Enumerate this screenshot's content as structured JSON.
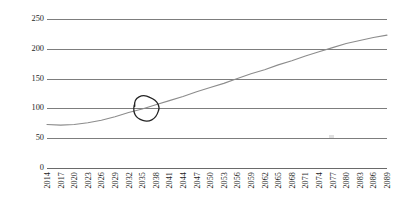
{
  "chart_data": {
    "type": "line",
    "title": "",
    "xlabel": "",
    "ylabel": "Percentage of GDP",
    "ylim": [
      0,
      250
    ],
    "yticks": [
      0,
      50,
      100,
      150,
      200,
      250
    ],
    "ytick_labels": [
      "0",
      "50",
      "100",
      "150",
      "200",
      "250"
    ],
    "grid": true,
    "legend": "none",
    "xlim": [
      2014,
      2089
    ],
    "xticks": [
      2014,
      2017,
      2020,
      2023,
      2026,
      2029,
      2032,
      2035,
      2038,
      2041,
      2044,
      2047,
      2050,
      2053,
      2056,
      2059,
      2062,
      2065,
      2068,
      2071,
      2074,
      2077,
      2080,
      2083,
      2086,
      2089
    ],
    "xtick_labels": [
      "2014",
      "2017",
      "2020",
      "2023",
      "2026",
      "2029",
      "2032",
      "2035",
      "2038",
      "2041",
      "2044",
      "2047",
      "2050",
      "2053",
      "2056",
      "2059",
      "2062",
      "2065",
      "2068",
      "2071",
      "2074",
      "2077",
      "2080",
      "2083",
      "2086",
      "2089"
    ],
    "series": [
      {
        "name": "Percentage of GDP",
        "color": "#8c8c8c",
        "x": [
          2014,
          2017,
          2020,
          2023,
          2026,
          2029,
          2032,
          2035,
          2038,
          2041,
          2044,
          2047,
          2050,
          2053,
          2056,
          2059,
          2062,
          2065,
          2068,
          2071,
          2074,
          2077,
          2080,
          2083,
          2086,
          2089
        ],
        "values": [
          73,
          72,
          73,
          76,
          80,
          86,
          93,
          99,
          106,
          113,
          120,
          128,
          135,
          142,
          150,
          158,
          165,
          173,
          180,
          188,
          195,
          202,
          209,
          214,
          219,
          223
        ]
      }
    ],
    "annotations": [
      {
        "name": "hand-drawn-circle",
        "shape": "ellipse",
        "color": "#232323",
        "center_x": 2036,
        "center_y": 100,
        "note": "hand-drawn circle highlighting where the projection crosses 100 percent of GDP"
      }
    ]
  },
  "axes": {
    "y_title": "Percentage of GDP"
  }
}
